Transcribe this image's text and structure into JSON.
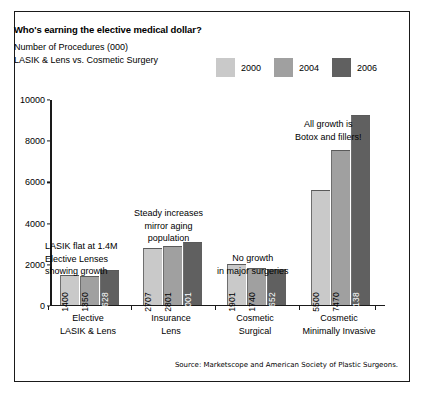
{
  "header": {
    "title": "Who's earning the elective medical dollar?",
    "subtitle_line1": "Number of Procedures (000)",
    "subtitle_line2": "LASIK & Lens vs. Cosmetic Surgery"
  },
  "source": "Source: Marketscope and American Society of Plastic Surgeons.",
  "colors": {
    "series_2000": "#c9c9c9",
    "series_2004": "#a0a0a0",
    "series_2006": "#606060",
    "axis": "#1a1a1a",
    "frame": "#1a1a1a",
    "background": "#ffffff"
  },
  "annotations": [
    {
      "id": "lasik",
      "line1": "LASIK flat at 1.4M",
      "line2": "Elective Lenses",
      "line3": "showing growth"
    },
    {
      "id": "insurance",
      "line1": "Steady increases",
      "line2": "mirror aging",
      "line3": "population"
    },
    {
      "id": "cosmetic-surgical",
      "line1": "No growth",
      "line2": "in major surgeries",
      "line3": ""
    },
    {
      "id": "cosmetic-minimally-invasive",
      "line1": "All growth is",
      "line2": "Botox and fillers!",
      "line3": ""
    }
  ],
  "chart_data": {
    "type": "bar",
    "title": "Who's earning the elective medical dollar?",
    "subtitle": "Number of Procedures (000) / LASIK & Lens vs. Cosmetic Surgery",
    "xlabel": "",
    "ylabel": "",
    "ylim": [
      0,
      10000
    ],
    "yticks": [
      0,
      2000,
      4000,
      6000,
      8000,
      10000
    ],
    "ytick_labels": [
      "0",
      "2000",
      "4000",
      "6000",
      "8000",
      "10000"
    ],
    "grid": false,
    "legend_position": "top-right",
    "categories": [
      {
        "line1": "Elective",
        "line2": "LASIK & Lens"
      },
      {
        "line1": "Insurance",
        "line2": "Lens"
      },
      {
        "line1": "Cosmetic",
        "line2": "Surgical"
      },
      {
        "line1": "Cosmetic",
        "line2": "Minimally Invasive"
      }
    ],
    "category_labels": [
      "Elective LASIK & Lens",
      "Insurance Lens",
      "Cosmetic Surgical",
      "Cosmetic Minimally Invasive"
    ],
    "series": [
      {
        "name": "2000",
        "color": "#c9c9c9",
        "values": [
          1400,
          2707,
          1901,
          5500
        ]
      },
      {
        "name": "2004",
        "color": "#a0a0a0",
        "values": [
          1350,
          2801,
          1740,
          7470
        ]
      },
      {
        "name": "2006",
        "color": "#606060",
        "values": [
          1628,
          3001,
          1652,
          9138
        ]
      }
    ],
    "annotations": [
      "LASIK flat at 1.4M Elective Lenses showing growth",
      "Steady increases mirror aging population",
      "No growth in major surgeries",
      "All growth is Botox and fillers!"
    ],
    "source": "Source: Marketscope and American Society of Plastic Surgeons."
  }
}
